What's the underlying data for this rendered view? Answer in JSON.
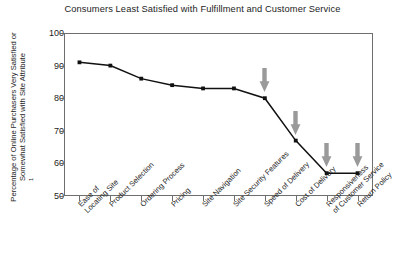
{
  "chart_data": {
    "type": "line",
    "title": "Consumers Least Satisfied with Fulfillment and Customer Service",
    "xlabel": "",
    "ylabel": "Percentage of Online Purchasers Very Satisfied or Somewhat Satisfied with Site Attribute",
    "ylabel_line1": "Percentage of Online Purchasers Very Satisfied or",
    "ylabel_line2": "Somewhat Satisfied with Site Attribute",
    "ylabel_footnote_marker": "1",
    "ylim": [
      50,
      100
    ],
    "yticks": [
      100,
      90,
      80,
      70,
      60,
      50
    ],
    "ytick_labels": [
      "100",
      "90",
      "80",
      "70",
      "60",
      "50"
    ],
    "grid": false,
    "legend": "none",
    "series_name": "Percent very or somewhat satisfied",
    "categories": [
      "Ease of Locating Site",
      "Product Selection",
      "Ordering Process",
      "Pricing",
      "Site Navigation",
      "Site Security Features",
      "Speed of Delivery",
      "Cost of Delivery",
      "Responsiveness of Customer Service",
      "Return Policy"
    ],
    "category_lines": [
      [
        "Ease of",
        "Locating Site"
      ],
      [
        "Product Selection"
      ],
      [
        "Ordering Process"
      ],
      [
        "Pricing"
      ],
      [
        "Site Navigation"
      ],
      [
        "Site Security Features"
      ],
      [
        "Speed of Delivery"
      ],
      [
        "Cost of Delivery"
      ],
      [
        "Responsiveness",
        "of Customer Service"
      ],
      [
        "Return Policy"
      ]
    ],
    "values": [
      91,
      90,
      86,
      84,
      83,
      83,
      80,
      67,
      57,
      57
    ],
    "marker": "square",
    "line_color": "#111111",
    "marker_color": "#111111",
    "annotations": [
      {
        "label": "arrow-speed-of-delivery",
        "category": "Speed of Delivery",
        "value": 80,
        "direction": "down",
        "color": "#9a9a9a"
      },
      {
        "label": "arrow-cost-of-delivery",
        "category": "Cost of Delivery",
        "value": 67,
        "direction": "down",
        "color": "#9a9a9a"
      },
      {
        "label": "arrow-responsiveness-of-customer-service",
        "category": "Responsiveness of Customer Service",
        "value": 57,
        "direction": "down",
        "color": "#9a9a9a"
      },
      {
        "label": "arrow-return-policy",
        "category": "Return Policy",
        "value": 57,
        "direction": "down",
        "color": "#9a9a9a"
      }
    ]
  },
  "colors": {
    "background": "#ffffff",
    "axis": "#6e6e6e",
    "text": "#1d1d1d",
    "line": "#111111",
    "arrow": "#9a9a9a"
  }
}
